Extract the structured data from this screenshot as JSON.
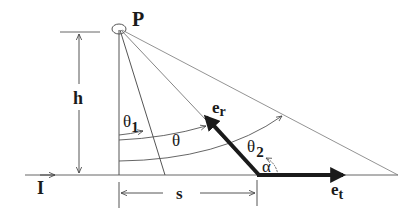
{
  "diagram": {
    "colors": {
      "line": "#555555",
      "thick": "#1a1a1a",
      "background": "#ffffff"
    },
    "labels": {
      "point": "P",
      "height": "h",
      "distance": "s",
      "line": "I",
      "theta1": "θ",
      "theta1_sub": "1",
      "theta": "θ",
      "theta2": "θ",
      "theta2_sub": "2",
      "alpha": "α",
      "er": "e",
      "er_sub": "r",
      "et": "e",
      "et_sub": "t"
    }
  }
}
